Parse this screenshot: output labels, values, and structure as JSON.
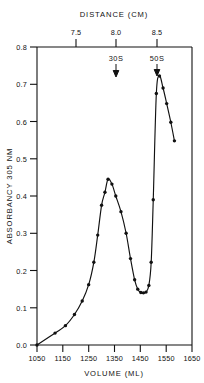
{
  "chart_data": {
    "type": "line",
    "title": "",
    "xlabel": "VOLUME (ML)",
    "ylabel": "ABSORBANCY 305 NM",
    "top_axis_label": "DISTANCE  (CM)",
    "xlim": [
      1050,
      1650
    ],
    "ylim": [
      0.0,
      0.8
    ],
    "xticks": [
      1050,
      1150,
      1250,
      1350,
      1450,
      1550,
      1650
    ],
    "xticklabels": [
      "1050",
      "1150",
      "1250",
      "1350",
      "1450",
      "1550",
      "1650"
    ],
    "yticks": [
      0.0,
      0.1,
      0.2,
      0.3,
      0.4,
      0.5,
      0.6,
      0.7,
      0.8
    ],
    "yticklabels": [
      "0.0",
      "0.1",
      "0.2",
      "0.3",
      "0.4",
      "0.5",
      "0.6",
      "0.7",
      "0.8"
    ],
    "top_xticks": [
      7.5,
      8.0,
      8.5
    ],
    "top_xticklabels": [
      "7.5",
      "8.0",
      "8.5"
    ],
    "top_axis_lim": [
      7.0,
      8.9
    ],
    "grid": false,
    "legend": false,
    "markers": "filled-circle",
    "annotations": [
      {
        "label": "30S",
        "x": 1350,
        "y": 0.8,
        "arrow": "down"
      },
      {
        "label": "50S",
        "x": 1500,
        "y": 0.8,
        "arrow": "down"
      }
    ],
    "series": [
      {
        "name": "Absorbancy 305 nm",
        "x": [
          1050,
          1120,
          1160,
          1195,
          1225,
          1250,
          1270,
          1285,
          1300,
          1313,
          1325,
          1340,
          1355,
          1375,
          1395,
          1412,
          1428,
          1440,
          1452,
          1462,
          1472,
          1483,
          1492,
          1500,
          1512,
          1524,
          1538,
          1552,
          1568,
          1582
        ],
        "y": [
          0.0,
          0.032,
          0.052,
          0.082,
          0.118,
          0.162,
          0.222,
          0.295,
          0.375,
          0.41,
          0.445,
          0.432,
          0.4,
          0.358,
          0.3,
          0.232,
          0.175,
          0.15,
          0.141,
          0.14,
          0.142,
          0.16,
          0.222,
          0.39,
          0.675,
          0.722,
          0.69,
          0.648,
          0.598,
          0.548
        ],
        "color": "#111111"
      }
    ]
  }
}
